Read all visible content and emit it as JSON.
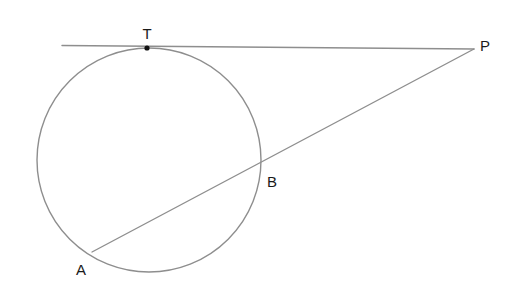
{
  "figure": {
    "type": "geometry-diagram",
    "background_color": "#ffffff",
    "stroke_color": "#8a8a8a",
    "label_color": "#1a1a1a",
    "point_color": "#111111"
  },
  "circle": {
    "name": "circle",
    "cx": 149,
    "cy": 160,
    "r": 112,
    "stroke_color": "#8e8e8e",
    "stroke_width": 1.4
  },
  "lines": {
    "tangent": {
      "name": "tangent-line-TP",
      "x1": 62,
      "y1": 45.5,
      "x2": 474,
      "y2": 49,
      "stroke_color": "#8e8e8e",
      "stroke_width": 1.4
    },
    "secant": {
      "name": "secant-line-AP",
      "x1": 92,
      "y1": 252,
      "x2": 474,
      "y2": 49,
      "stroke_color": "#8e8e8e",
      "stroke_width": 1.4
    }
  },
  "points": [
    {
      "id": "T",
      "label": "T",
      "cx": 147,
      "cy": 48,
      "label_x": 147,
      "label_y": 33,
      "marked": true,
      "dot_r": 2.6,
      "role": "point-of-tangency"
    },
    {
      "id": "P",
      "label": "P",
      "cx": 474,
      "cy": 49,
      "label_x": 485,
      "label_y": 45,
      "marked": false,
      "dot_r": 0,
      "role": "external-point"
    },
    {
      "id": "B",
      "label": "B",
      "cx": 258,
      "cy": 167,
      "label_x": 272,
      "label_y": 181,
      "marked": false,
      "dot_r": 0,
      "role": "near-secant-intersection"
    },
    {
      "id": "A",
      "label": "A",
      "cx": 92,
      "cy": 252,
      "label_x": 81,
      "label_y": 269,
      "marked": false,
      "dot_r": 0,
      "role": "far-secant-intersection"
    }
  ]
}
